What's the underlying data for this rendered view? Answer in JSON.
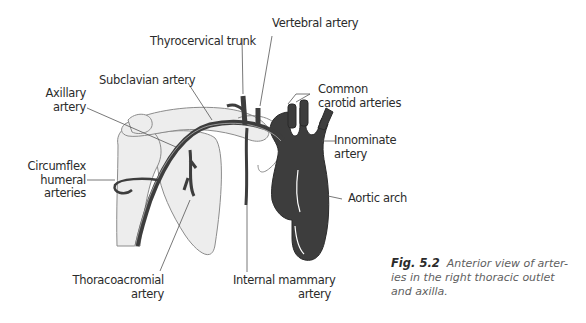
{
  "figure": {
    "number": "Fig. 5.2",
    "caption_lines": [
      "Anterior view of arter-",
      "ies in the right thoracic outlet",
      "and axilla."
    ],
    "colors": {
      "artery_fill": "#3d3d3d",
      "bone_fill": "#ececec",
      "bone_outline": "#8a8a8a",
      "leader_line": "#444444",
      "background": "#ffffff"
    }
  },
  "labels": {
    "vertebral_artery": "Vertebral artery",
    "thyrocervical_trunk": "Thyrocervical trunk",
    "subclavian_artery": "Subclavian artery",
    "axillary_artery": [
      "Axillary",
      "artery"
    ],
    "common_carotid_arteries": [
      "Common",
      "carotid arteries"
    ],
    "innominate_artery": [
      "Innominate",
      "artery"
    ],
    "circumflex_humeral_arteries": [
      "Circumflex",
      "humeral",
      "arteries"
    ],
    "aortic_arch": "Aortic arch",
    "thoracoacromial_artery": [
      "Thoracoacromial",
      "artery"
    ],
    "internal_mammary_artery": [
      "Internal mammary",
      "artery"
    ]
  }
}
